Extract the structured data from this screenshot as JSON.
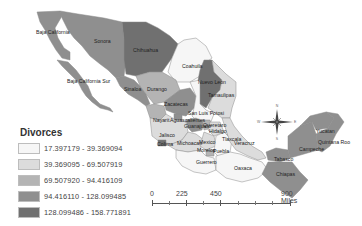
{
  "legend": {
    "title": "Divorces",
    "classes": [
      {
        "label": "17.397179 - 39.369094",
        "color": "#f6f6f6"
      },
      {
        "label": "39.369095 - 69.507919",
        "color": "#dcdcdc"
      },
      {
        "label": "69.507920 - 94.416109",
        "color": "#b4b4b4"
      },
      {
        "label": "94.416110 - 128.099485",
        "color": "#8f8f8f"
      },
      {
        "label": "128.099486 - 158.771891",
        "color": "#707070"
      }
    ]
  },
  "scale_bar": {
    "labels": [
      "0",
      "225",
      "450",
      "900 Miles"
    ]
  },
  "compass": {
    "N": "N",
    "S": "S",
    "E": "E",
    "W": "W"
  },
  "states": {
    "baja_california": "Baja California",
    "sonora": "Sonora",
    "chihuahua": "Chihuahua",
    "coahuila": "Coahuila",
    "nuevo_leon": "Nuevo Leon",
    "tamaulipas": "Tamaulipas",
    "baja_california_sur": "Baja California Sur",
    "sinaloa": "Sinaloa",
    "durango": "Durango",
    "zacatecas": "Zacatecas",
    "san_luis_potosi": "San Luis Potosi",
    "nayarit": "Nayarit",
    "aguascalientes": "Aguascalientes",
    "guanajuato": "Guanajuato",
    "queretaro": "Queretaro",
    "hidalgo": "Hidalgo",
    "jalisco": "Jalisco",
    "colima": "Colima",
    "michoacan": "Michoacan",
    "mexico": "Mexico",
    "tlaxcala": "Tlaxcala",
    "veracruz": "Veracruz",
    "morelos": "Morelos",
    "puebla": "Puebla",
    "guerrero": "Guerrero",
    "oaxaca": "Oaxaca",
    "tabasco": "Tabasco",
    "chiapas": "Chiapas",
    "campeche": "Campeche",
    "yucatan": "Yucatan",
    "quintana_roo": "Quintana Roo"
  }
}
